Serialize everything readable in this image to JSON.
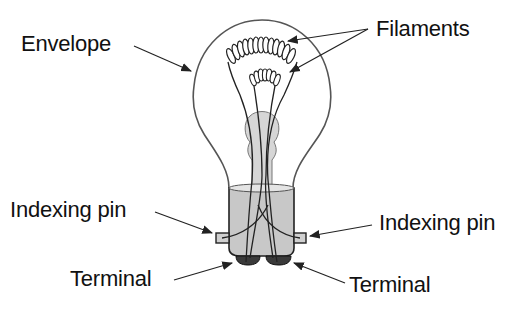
{
  "labels": {
    "envelope": "Envelope",
    "filaments": "Filaments",
    "indexing_pin_left": "Indexing pin",
    "indexing_pin_right": "Indexing pin",
    "terminal_left": "Terminal",
    "terminal_right": "Terminal"
  },
  "colors": {
    "line": "#222222",
    "outline": "#555555",
    "base_fill": "#c8c8c8",
    "stem_fill": "#d6d6d6",
    "terminal_fill": "#3a3a3a",
    "background": "#ffffff"
  }
}
